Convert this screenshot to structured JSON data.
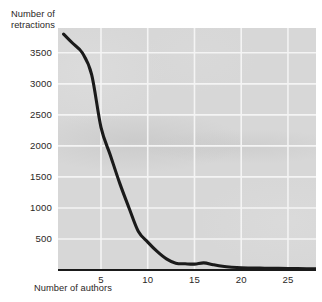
{
  "chart_data": {
    "type": "line",
    "title": "",
    "subtitle": "",
    "xlabel": "Number of authors",
    "ylabel": "Number of retractions",
    "xlim": [
      0.4,
      28
    ],
    "ylim": [
      0,
      3900
    ],
    "xticks": [
      5,
      10,
      15,
      20,
      25
    ],
    "xtick_labels": [
      "5",
      "10",
      "15",
      "20",
      "25"
    ],
    "yticks": [
      500,
      1000,
      1500,
      2000,
      2500,
      3000,
      3500
    ],
    "ytick_labels": [
      "500",
      "1000",
      "1500",
      "2000",
      "2500",
      "3000",
      "3500"
    ],
    "grid": true,
    "grid_color": "#f4f4f4",
    "plot_background": "#d7d7d7",
    "line_color": "#1a1a1a",
    "line_width": 3.1,
    "legend": null,
    "legend_position": "none",
    "annotations": [],
    "series": [
      {
        "name": "Retractions",
        "x": [
          1,
          2,
          3,
          4,
          5,
          6,
          7,
          8,
          9,
          10,
          11,
          12,
          13,
          14,
          15,
          16,
          17,
          18,
          19,
          20,
          21,
          22,
          23,
          24,
          25,
          26,
          27,
          28
        ],
        "values": [
          3800,
          3650,
          3500,
          3150,
          2300,
          1850,
          1400,
          1000,
          620,
          450,
          300,
          180,
          110,
          100,
          95,
          115,
          85,
          60,
          45,
          35,
          32,
          30,
          28,
          26,
          24,
          22,
          20,
          20
        ]
      }
    ]
  },
  "axes": {
    "y_title_line1": "Number of",
    "y_title_line2": "retractions",
    "x_title": "Number of authors"
  },
  "colors": {
    "line": "#1a1a1a",
    "panel": "#d7d7d7",
    "grid": "#f4f4f4",
    "text": "#2b2726",
    "page": "#ffffff"
  }
}
